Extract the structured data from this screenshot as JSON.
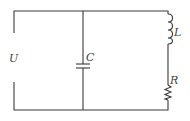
{
  "diagram": {
    "type": "circuit",
    "components": [
      {
        "id": "source",
        "label": "U",
        "kind": "voltage-source-terminals"
      },
      {
        "id": "capacitor",
        "label": "C",
        "kind": "capacitor"
      },
      {
        "id": "inductor",
        "label": "L",
        "kind": "inductor"
      },
      {
        "id": "resistor",
        "label": "R",
        "kind": "resistor"
      }
    ],
    "colors": {
      "wire": "#3a3a3a",
      "label": "#444444",
      "background": "#ffffff"
    }
  }
}
